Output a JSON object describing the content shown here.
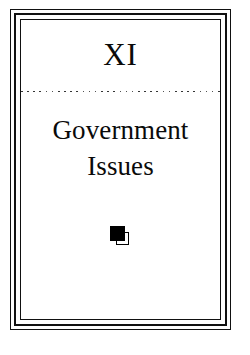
{
  "page": {
    "type": "book-chapter-title-page",
    "background_color": "#ffffff",
    "ink_color": "#000000"
  },
  "frame": {
    "style": "triple-rule-border",
    "line_color": "#111111",
    "rules": [
      {
        "name": "outer-rule",
        "width_px": 1
      },
      {
        "name": "middle-rule",
        "width_px": 2
      },
      {
        "name": "inner-rule",
        "width_px": 1
      }
    ]
  },
  "chapter": {
    "number": "XI",
    "title_lines": [
      "Government",
      "Issues"
    ],
    "title_full": "Government Issues"
  },
  "divider": {
    "name": "dotted-rule",
    "style": "dotted",
    "dot_count": 33,
    "dot_color": "#1a1a1a"
  },
  "ornament": {
    "name": "double-square-ornament",
    "description": "filled black square overlapping an outlined open square",
    "filled_color": "#000000",
    "outline_color": "#000000"
  }
}
